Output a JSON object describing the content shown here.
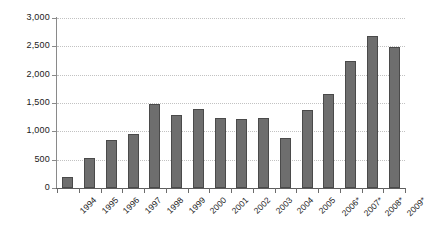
{
  "chart_data": {
    "type": "bar",
    "title": "",
    "subtitle": "",
    "xlabel": "",
    "ylabel": "",
    "categories": [
      "1994",
      "1995",
      "1996",
      "1997",
      "1998",
      "1999",
      "2000",
      "2001",
      "2002",
      "2003",
      "2004",
      "2005",
      "2006*",
      "2007*",
      "2008*",
      "2009*"
    ],
    "values": [
      190,
      530,
      840,
      950,
      1480,
      1290,
      1400,
      1240,
      1220,
      1230,
      880,
      1380,
      1660,
      2250,
      2690,
      2490
    ],
    "series": [
      {
        "name": "",
        "values": [
          190,
          530,
          840,
          950,
          1480,
          1290,
          1400,
          1240,
          1220,
          1230,
          880,
          1380,
          1660,
          2250,
          2690,
          2490
        ]
      }
    ],
    "ylim": [
      0,
      3000
    ],
    "yticks": [
      0,
      500,
      1000,
      1500,
      2000,
      2500,
      3000
    ],
    "ytick_labels": [
      "0",
      "500",
      "1,000",
      "1,500",
      "2,000",
      "2,500",
      "3,000"
    ],
    "grid": true,
    "grid_axis": "y",
    "legend": false,
    "legend_position": "none",
    "annotations": [
      "* denotes projected or estimated values for 2006-2009"
    ],
    "bar_color": "#6e6e6e",
    "bar_border_color": "#4a4a4a",
    "gridline_color": "#c2c2c2",
    "axis_color": "#5d5d5d",
    "background_color": "#ffffff",
    "text_color": "#1a1a1a"
  }
}
